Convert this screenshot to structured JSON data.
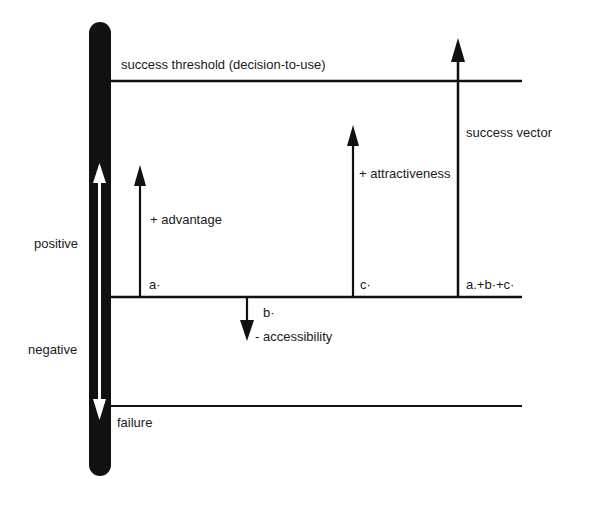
{
  "diagram": {
    "threshold_label": "success threshold (decision-to-use)",
    "success_vector_label": "success vector",
    "attractiveness_label": "+ attractiveness",
    "advantage_label": "+ advantage",
    "accessibility_label": "- accessibility",
    "a_label": "a·",
    "b_label": "b·",
    "c_label": "c·",
    "sum_label": "a.+b·+c·",
    "positive_label": "positive",
    "negative_label": "negative",
    "failure_label": "failure"
  },
  "colors": {
    "ink": "#111111",
    "background": "#ffffff"
  }
}
